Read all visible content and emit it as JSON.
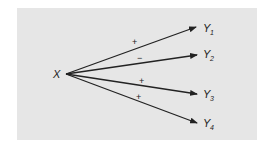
{
  "diagram": {
    "source": {
      "label": "X"
    },
    "targets": [
      {
        "label": "Y",
        "subscript": "1",
        "sign": "+"
      },
      {
        "label": "Y",
        "subscript": "2",
        "sign": "−"
      },
      {
        "label": "Y",
        "subscript": "3",
        "sign": "+"
      },
      {
        "label": "Y",
        "subscript": "4",
        "sign": "+"
      }
    ],
    "colors": {
      "background": "#e6e6e6",
      "line": "#222222"
    }
  }
}
